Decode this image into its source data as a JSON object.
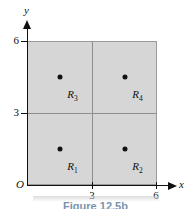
{
  "figure": {
    "caption": "Figure 12.5b",
    "origin_label": "O",
    "axes": {
      "x_name": "x",
      "y_name": "y",
      "x_ticks": [
        "3",
        "6"
      ],
      "y_ticks": [
        "3",
        "6"
      ]
    },
    "regions": [
      {
        "label": "R",
        "index": "1"
      },
      {
        "label": "R",
        "index": "2"
      },
      {
        "label": "R",
        "index": "3"
      },
      {
        "label": "R",
        "index": "4"
      }
    ]
  },
  "chart_data": {
    "type": "scatter",
    "title": "Figure 12.5b",
    "xlabel": "x",
    "ylabel": "y",
    "xlim": [
      0,
      6
    ],
    "ylim": [
      0,
      6
    ],
    "xticks": [
      3,
      6
    ],
    "yticks": [
      3,
      6
    ],
    "grid": false,
    "legend": "none",
    "shaded_region": {
      "x_range": [
        0,
        6
      ],
      "y_range": [
        0,
        6
      ],
      "fill": "#d6d6d6"
    },
    "partition_lines": {
      "vertical_x": [
        3
      ],
      "horizontal_y": [
        3
      ]
    },
    "subregions": [
      {
        "name": "R1",
        "x_range": [
          0,
          3
        ],
        "y_range": [
          0,
          3
        ],
        "label_x": 2.1,
        "label_y": 0.7
      },
      {
        "name": "R2",
        "x_range": [
          3,
          6
        ],
        "y_range": [
          0,
          3
        ],
        "label_x": 5.1,
        "label_y": 0.7
      },
      {
        "name": "R3",
        "x_range": [
          0,
          3
        ],
        "y_range": [
          3,
          6
        ],
        "label_x": 2.1,
        "label_y": 3.7
      },
      {
        "name": "R4",
        "x_range": [
          3,
          6
        ],
        "y_range": [
          3,
          6
        ],
        "label_x": 5.1,
        "label_y": 3.7
      }
    ],
    "points": [
      {
        "x": 1.5,
        "y": 1.5,
        "region": "R1"
      },
      {
        "x": 4.5,
        "y": 1.5,
        "region": "R2"
      },
      {
        "x": 1.5,
        "y": 4.5,
        "region": "R3"
      },
      {
        "x": 4.5,
        "y": 4.5,
        "region": "R4"
      }
    ],
    "colors": {
      "fill": "#d6d6d6",
      "axis": "#111111",
      "point": "#111111",
      "caption": "#7a93ad"
    }
  }
}
